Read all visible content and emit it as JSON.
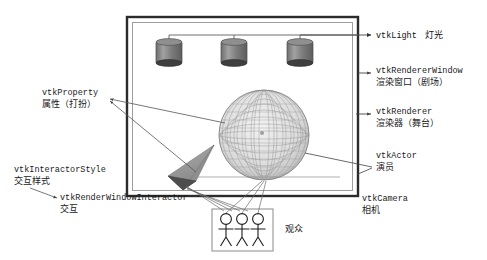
{
  "diagram": {
    "colors": {
      "frame_outer": "#2b2b2b",
      "frame_inner": "#9a9a9a",
      "lamp_body": "#7d7d7d",
      "lamp_dark": "#4f4f4f",
      "sphere_mesh": "#8c8c8c",
      "cone_fill": "#9c9c9c",
      "cone_dark": "#4a4a4a",
      "line": "#555555",
      "text": "#1a1a1a",
      "audience_box": "#8a8a8a"
    },
    "stage": {
      "name": "render-window-frame",
      "lights_count": 3,
      "sphere": {
        "name": "actor-sphere"
      },
      "cone": {
        "name": "camera-cone"
      }
    },
    "audience": {
      "label": "观众",
      "figure_count": 3
    },
    "labels": {
      "light": {
        "en": "vtkLight",
        "cn": "灯光"
      },
      "renderer_window": {
        "en": "vtkRendererWindow",
        "cn": "渲染窗口（剧场）"
      },
      "renderer": {
        "en": "vtkRenderer",
        "cn": "渲染器（舞台）"
      },
      "actor": {
        "en": "vtkActor",
        "cn": "演员"
      },
      "camera": {
        "en": "vtkCamera",
        "cn": "相机"
      },
      "property": {
        "en": "vtkProperty",
        "cn": "属性（打扮）"
      },
      "interactor_style": {
        "en": "vtkInteractorStyle",
        "cn": "交互样式"
      },
      "render_window_interactor": {
        "en": "vtkRenderWindowInteractor",
        "cn": "交互"
      }
    }
  }
}
